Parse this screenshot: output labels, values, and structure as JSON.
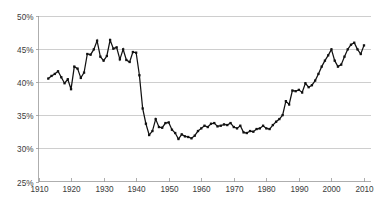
{
  "chart_data": {
    "type": "line",
    "title": "",
    "subtitle": "",
    "xlabel": "",
    "ylabel": "",
    "xlim": [
      1910,
      2012
    ],
    "ylim": [
      25,
      50
    ],
    "grid": true,
    "legend": "none",
    "y_tick_labels": [
      "50%",
      "45%",
      "40%",
      "35%",
      "30%",
      "25%"
    ],
    "y_tick_values": [
      50,
      45,
      40,
      35,
      30,
      25
    ],
    "x_tick_labels": [
      "1910",
      "1920",
      "1930",
      "1940",
      "1950",
      "1960",
      "1970",
      "1980",
      "1990",
      "2000",
      "2010"
    ],
    "x_tick_values": [
      1910,
      1920,
      1930,
      1940,
      1950,
      1960,
      1970,
      1980,
      1990,
      2000,
      2010
    ],
    "line_color": "#111111",
    "grid_color": "#b9b9b9",
    "axis_color": "#9a9a9a",
    "background_color": "#ffffff",
    "marker": "square",
    "series": [
      {
        "name": "Share",
        "x": [
          1913,
          1914,
          1915,
          1916,
          1917,
          1918,
          1919,
          1920,
          1921,
          1922,
          1923,
          1924,
          1925,
          1926,
          1927,
          1928,
          1929,
          1930,
          1931,
          1932,
          1933,
          1934,
          1935,
          1936,
          1937,
          1938,
          1939,
          1940,
          1941,
          1942,
          1943,
          1944,
          1945,
          1946,
          1947,
          1948,
          1949,
          1950,
          1951,
          1952,
          1953,
          1954,
          1955,
          1956,
          1957,
          1958,
          1959,
          1960,
          1961,
          1962,
          1963,
          1964,
          1965,
          1966,
          1967,
          1968,
          1969,
          1970,
          1971,
          1972,
          1973,
          1974,
          1975,
          1976,
          1977,
          1978,
          1979,
          1980,
          1981,
          1982,
          1983,
          1984,
          1985,
          1986,
          1987,
          1988,
          1989,
          1990,
          1991,
          1992,
          1993,
          1994,
          1995,
          1996,
          1997,
          1998,
          1999,
          2000,
          2001,
          2002,
          2003,
          2004,
          2005,
          2006,
          2007,
          2008,
          2009,
          2010
        ],
        "values": [
          40.5,
          40.9,
          41.2,
          41.6,
          40.7,
          39.8,
          40.4,
          38.9,
          42.3,
          42.0,
          40.6,
          41.4,
          44.2,
          44.1,
          44.9,
          46.2,
          43.8,
          43.2,
          43.9,
          46.3,
          45.0,
          45.2,
          43.4,
          44.9,
          43.3,
          43.0,
          44.5,
          44.4,
          41.0,
          36.0,
          33.7,
          32.0,
          32.6,
          34.4,
          33.2,
          33.1,
          33.8,
          33.9,
          32.8,
          32.3,
          31.4,
          32.1,
          31.8,
          31.7,
          31.5,
          31.9,
          32.6,
          33.0,
          33.4,
          33.2,
          33.7,
          33.8,
          33.3,
          33.4,
          33.6,
          33.5,
          33.8,
          33.2,
          33.0,
          33.4,
          32.4,
          32.3,
          32.6,
          32.5,
          32.9,
          33.0,
          33.4,
          33.0,
          32.9,
          33.5,
          34.0,
          34.4,
          35.0,
          37.1,
          36.6,
          38.7,
          38.6,
          38.8,
          38.4,
          39.8,
          39.2,
          39.5,
          40.2,
          41.2,
          42.3,
          43.2,
          44.0,
          44.9,
          43.2,
          42.3,
          42.6,
          43.8,
          44.9,
          45.6,
          45.9,
          44.9,
          44.2,
          45.5
        ]
      }
    ]
  }
}
